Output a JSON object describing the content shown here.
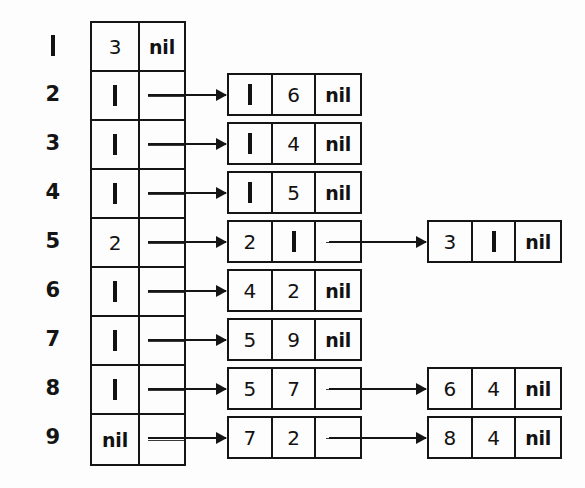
{
  "figure": {
    "kind": "linked-list-diagram",
    "colors": {
      "ink": "#151515",
      "paper": "#fdfdfd"
    },
    "nil_label": "nil"
  },
  "header_table": {
    "columns": [
      "data",
      "pointer"
    ],
    "rows": [
      {
        "index": "1",
        "data": "3",
        "pointer": "nil",
        "has_arrow": false
      },
      {
        "index": "2",
        "data": "1",
        "pointer": "arrow",
        "has_arrow": true
      },
      {
        "index": "3",
        "data": "1",
        "pointer": "arrow",
        "has_arrow": true
      },
      {
        "index": "4",
        "data": "1",
        "pointer": "arrow",
        "has_arrow": true
      },
      {
        "index": "5",
        "data": "2",
        "pointer": "arrow",
        "has_arrow": true
      },
      {
        "index": "6",
        "data": "1",
        "pointer": "arrow",
        "has_arrow": true
      },
      {
        "index": "7",
        "data": "1",
        "pointer": "arrow",
        "has_arrow": true
      },
      {
        "index": "8",
        "data": "1",
        "pointer": "arrow",
        "has_arrow": true
      },
      {
        "index": "9",
        "data": "nil",
        "pointer": "arrow",
        "has_arrow": true
      }
    ]
  },
  "chains": [
    {
      "row": "2",
      "nodes": [
        {
          "cells": [
            "1",
            "6",
            "nil"
          ],
          "tail": true
        }
      ]
    },
    {
      "row": "3",
      "nodes": [
        {
          "cells": [
            "1",
            "4",
            "nil"
          ],
          "tail": true
        }
      ]
    },
    {
      "row": "4",
      "nodes": [
        {
          "cells": [
            "1",
            "5",
            "nil"
          ],
          "tail": true
        }
      ]
    },
    {
      "row": "5",
      "nodes": [
        {
          "cells": [
            "2",
            "1",
            ""
          ],
          "tail": false
        },
        {
          "cells": [
            "3",
            "1",
            "nil"
          ],
          "tail": true
        }
      ]
    },
    {
      "row": "6",
      "nodes": [
        {
          "cells": [
            "4",
            "2",
            "nil"
          ],
          "tail": true
        }
      ]
    },
    {
      "row": "7",
      "nodes": [
        {
          "cells": [
            "5",
            "9",
            "nil"
          ],
          "tail": true
        }
      ]
    },
    {
      "row": "8",
      "nodes": [
        {
          "cells": [
            "5",
            "7",
            ""
          ],
          "tail": false
        },
        {
          "cells": [
            "6",
            "4",
            "nil"
          ],
          "tail": true
        }
      ]
    },
    {
      "row": "9",
      "nodes": [
        {
          "cells": [
            "7",
            "2",
            ""
          ],
          "tail": false
        },
        {
          "cells": [
            "8",
            "4",
            "nil"
          ],
          "tail": true
        }
      ]
    }
  ]
}
